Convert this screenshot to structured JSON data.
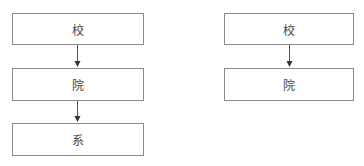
{
  "diagrams": [
    {
      "name": "left-hierarchy",
      "nodes": [
        {
          "label": "校"
        },
        {
          "label": "院"
        },
        {
          "label": "系"
        }
      ]
    },
    {
      "name": "right-hierarchy",
      "nodes": [
        {
          "label": "校"
        },
        {
          "label": "院"
        }
      ]
    }
  ],
  "colors": {
    "border": "#8a8a8a",
    "arrow": "#333333"
  }
}
